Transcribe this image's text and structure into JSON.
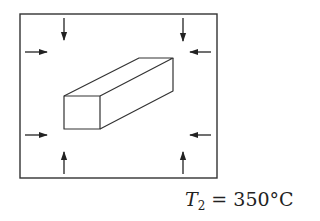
{
  "diagram": {
    "title": "",
    "enclosure": {
      "x": 20,
      "y": 14,
      "width": 197,
      "height": 164,
      "stroke": "#333333"
    },
    "bar": {
      "front_face": [
        [
          64,
          96
        ],
        [
          100,
          96
        ],
        [
          100,
          129
        ],
        [
          64,
          129
        ]
      ],
      "back_top_left": [
        139,
        58
      ],
      "back_top_right": [
        173,
        58
      ],
      "back_bottom_right": [
        173,
        91
      ]
    },
    "arrows": [
      {
        "id": "top-left-down",
        "direction": "down"
      },
      {
        "id": "top-right-down",
        "direction": "down"
      },
      {
        "id": "left-upper-right",
        "direction": "right"
      },
      {
        "id": "right-upper-left",
        "direction": "left"
      },
      {
        "id": "left-lower-right",
        "direction": "right"
      },
      {
        "id": "right-lower-left",
        "direction": "left"
      },
      {
        "id": "bottom-left-up",
        "direction": "up"
      },
      {
        "id": "bottom-right-up",
        "direction": "up"
      }
    ],
    "temperature_label": {
      "variable": "T",
      "subscript": "2",
      "value": " = 350°C"
    }
  }
}
